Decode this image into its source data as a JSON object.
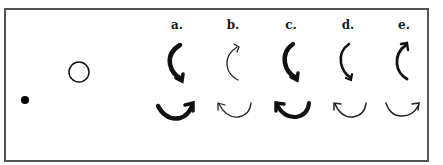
{
  "figure": {
    "frame": {
      "x": 5,
      "y": 9,
      "width": 423,
      "height": 152,
      "stroke": "#555555"
    },
    "dot": {
      "cx": 25,
      "cy": 100,
      "r": 4,
      "color": "#000000"
    },
    "circle": {
      "cx": 79,
      "cy": 72,
      "r": 10,
      "color": "#111111"
    },
    "columns": [
      {
        "label": "a.",
        "x": 177,
        "top_arrow": {
          "weight": "thick",
          "head": "bottom"
        },
        "bottom_arrow": {
          "weight": "thick",
          "head": "right"
        }
      },
      {
        "label": "b.",
        "x": 233,
        "top_arrow": {
          "weight": "thin",
          "head": "top"
        },
        "bottom_arrow": {
          "weight": "thin",
          "head": "left"
        }
      },
      {
        "label": "c.",
        "x": 291,
        "top_arrow": {
          "weight": "thick",
          "head": "bottom"
        },
        "bottom_arrow": {
          "weight": "thick",
          "head": "left"
        }
      },
      {
        "label": "d.",
        "x": 348,
        "top_arrow": {
          "weight": "medium",
          "head": "bottom"
        },
        "bottom_arrow": {
          "weight": "thin",
          "head": "left"
        }
      },
      {
        "label": "e.",
        "x": 404,
        "top_arrow": {
          "weight": "medium",
          "head": "top"
        },
        "bottom_arrow": {
          "weight": "thin",
          "head": "right"
        }
      }
    ]
  }
}
